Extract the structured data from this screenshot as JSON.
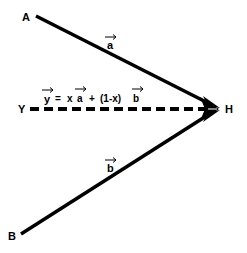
{
  "diagram": {
    "points": {
      "A": {
        "label": "A",
        "x": 36,
        "y": 16
      },
      "B": {
        "label": "B",
        "x": 21,
        "y": 234
      },
      "Y": {
        "label": "Y",
        "x": 29,
        "y": 109
      },
      "H": {
        "label": "H",
        "x": 218,
        "y": 109
      }
    },
    "vectors": [
      {
        "name": "a",
        "from": "A",
        "to": "H",
        "label": "a",
        "style": "solid"
      },
      {
        "name": "b",
        "from": "B",
        "to": "H",
        "label": "b",
        "style": "solid"
      },
      {
        "name": "y",
        "from": "Y",
        "to": "H",
        "label": "y",
        "style": "dashed"
      }
    ],
    "equation": {
      "lhs": "y",
      "equals": "=",
      "term1_coef": "x",
      "term1_vec": "a",
      "plus": "+",
      "term2_coef": "(1-x)",
      "term2_vec": "b",
      "full_text": "y = x a + (1-x) b"
    },
    "colors": {
      "stroke": "#000000",
      "background": "#ffffff"
    }
  }
}
